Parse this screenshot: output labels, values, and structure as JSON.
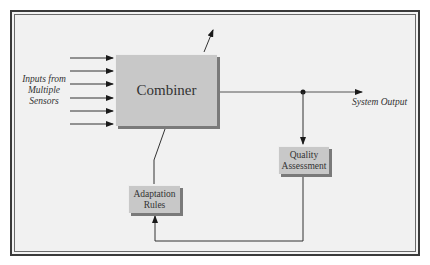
{
  "diagram": {
    "blocks": {
      "combiner": {
        "label": "Combiner"
      },
      "quality": {
        "label_line1": "Quality",
        "label_line2": "Assessment"
      },
      "adaptation": {
        "label_line1": "Adaptation",
        "label_line2": "Rules"
      }
    },
    "labels": {
      "inputs_line1": "Inputs from",
      "inputs_line2": "Multiple",
      "inputs_line3": "Sensors",
      "output": "System Output"
    },
    "input_arrow_count": 6,
    "edges": [
      {
        "from": "sensors",
        "to": "combiner",
        "count": 6
      },
      {
        "from": "combiner",
        "to": "system-output"
      },
      {
        "from": "output-junction",
        "to": "quality"
      },
      {
        "from": "quality",
        "to": "adaptation"
      },
      {
        "from": "adaptation",
        "to": "combiner"
      },
      {
        "from": "combiner",
        "to": "external-upward"
      }
    ],
    "colors": {
      "block_fill": "#c8c8c8",
      "block_shadow": "#7a7a7a",
      "background": "#f1f1f1",
      "line": "#333333"
    }
  }
}
